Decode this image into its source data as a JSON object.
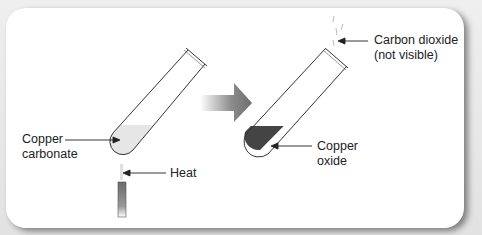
{
  "diagram": {
    "labels": {
      "copper_carbonate_1": "Copper",
      "copper_carbonate_2": "carbonate",
      "heat": "Heat",
      "carbon_dioxide_1": "Carbon dioxide",
      "carbon_dioxide_2": "(not visible)",
      "copper_oxide_1": "Copper",
      "copper_oxide_2": "oxide"
    },
    "colors": {
      "carbonate_fill": "#e8e8e8",
      "oxide_fill": "#444444",
      "arrow": "#8a8a8a",
      "outline": "#333333"
    }
  }
}
